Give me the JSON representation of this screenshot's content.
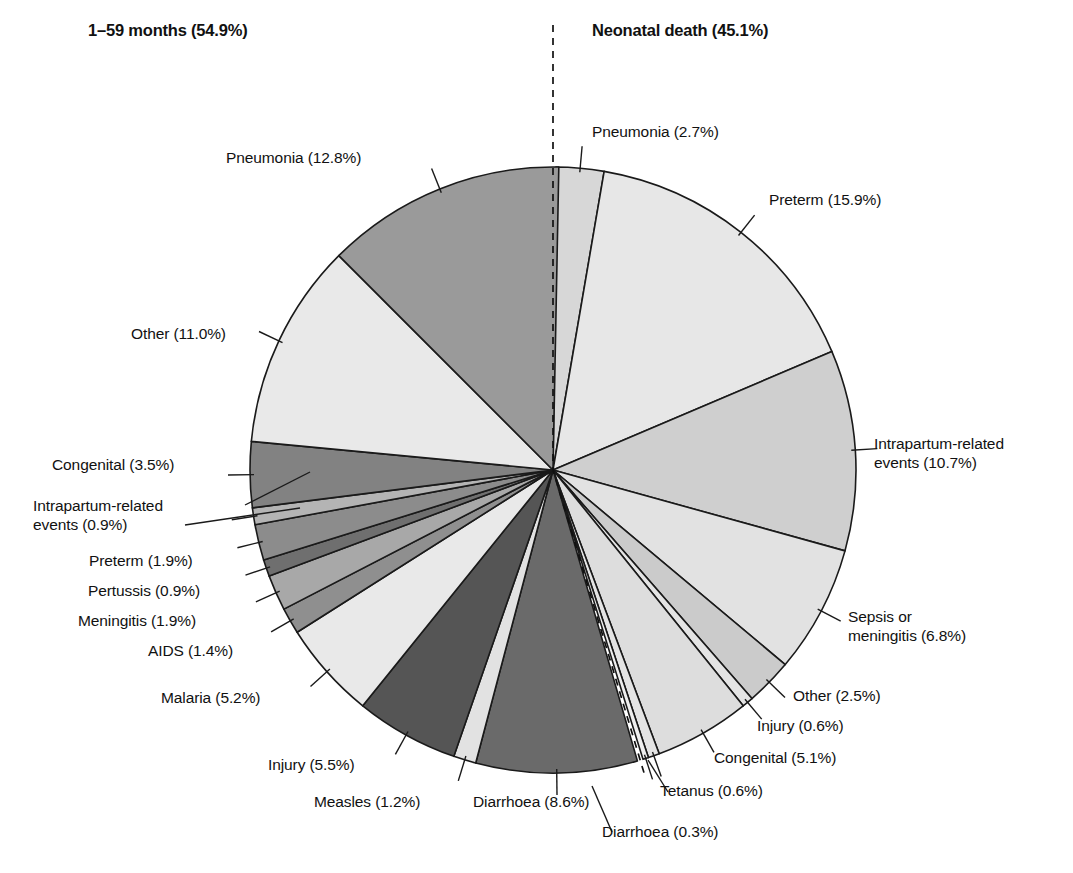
{
  "headers": {
    "left": "1–59 months (54.9%)",
    "right": "Neonatal death (45.1%)"
  },
  "labels": {
    "left": [
      {
        "name": "pneumonia",
        "text": "Pneumonia (12.8%)"
      },
      {
        "name": "other",
        "text": "Other (11.0%)"
      },
      {
        "name": "congenital",
        "text": "Congenital (3.5%)"
      },
      {
        "name": "intrapartum-line1",
        "text": "Intrapartum-related"
      },
      {
        "name": "intrapartum-line2",
        "text": "events (0.9%)"
      },
      {
        "name": "preterm",
        "text": "Preterm (1.9%)"
      },
      {
        "name": "pertussis",
        "text": "Pertussis (0.9%)"
      },
      {
        "name": "meningitis",
        "text": "Meningitis (1.9%)"
      },
      {
        "name": "aids",
        "text": "AIDS (1.4%)"
      },
      {
        "name": "malaria",
        "text": "Malaria (5.2%)"
      },
      {
        "name": "injury",
        "text": "Injury (5.5%)"
      },
      {
        "name": "measles",
        "text": "Measles (1.2%)"
      },
      {
        "name": "diarrhoea",
        "text": "Diarrhoea (8.6%)"
      }
    ],
    "right": [
      {
        "name": "pneumonia",
        "text": "Pneumonia (2.7%)"
      },
      {
        "name": "preterm",
        "text": "Preterm (15.9%)"
      },
      {
        "name": "intrapartum-line1",
        "text": "Intrapartum-related"
      },
      {
        "name": "intrapartum-line2",
        "text": "events (10.7%)"
      },
      {
        "name": "sepsis-line1",
        "text": "Sepsis or"
      },
      {
        "name": "sepsis-line2",
        "text": "meningitis (6.8%)"
      },
      {
        "name": "other",
        "text": "Other (2.5%)"
      },
      {
        "name": "injury",
        "text": "Injury (0.6%)"
      },
      {
        "name": "congenital",
        "text": "Congenital (5.1%)"
      },
      {
        "name": "tetanus",
        "text": "Tetanus (0.6%)"
      },
      {
        "name": "diarrhoea",
        "text": "Diarrhoea (0.3%)"
      }
    ]
  },
  "chart_data": {
    "type": "pie",
    "groups": [
      {
        "name": "1–59 months",
        "total_pct": 54.9,
        "side": "left",
        "slices": [
          {
            "label": "Pneumonia",
            "value": 12.8,
            "color": "#9a9a9a"
          },
          {
            "label": "Other",
            "value": 11.0,
            "color": "#e9e9e9"
          },
          {
            "label": "Congenital",
            "value": 3.5,
            "color": "#828282"
          },
          {
            "label": "Intrapartum-related events",
            "value": 0.9,
            "color": "#b4b4b4"
          },
          {
            "label": "Preterm",
            "value": 1.9,
            "color": "#8c8c8c"
          },
          {
            "label": "Pertussis",
            "value": 0.9,
            "color": "#6f6f6f"
          },
          {
            "label": "Meningitis",
            "value": 1.9,
            "color": "#a8a8a8"
          },
          {
            "label": "AIDS",
            "value": 1.4,
            "color": "#8f8f8f"
          },
          {
            "label": "Malaria",
            "value": 5.2,
            "color": "#e9e9e9"
          },
          {
            "label": "Injury",
            "value": 5.5,
            "color": "#555555"
          },
          {
            "label": "Measles",
            "value": 1.2,
            "color": "#e2e2e2"
          },
          {
            "label": "Diarrhoea",
            "value": 8.6,
            "color": "#6a6a6a"
          }
        ]
      },
      {
        "name": "Neonatal death",
        "total_pct": 45.1,
        "side": "right",
        "slices": [
          {
            "label": "Pneumonia",
            "value": 2.7,
            "color": "#d7d7d7"
          },
          {
            "label": "Preterm",
            "value": 15.9,
            "color": "#e7e7e7"
          },
          {
            "label": "Intrapartum-related events",
            "value": 10.7,
            "color": "#cfcfcf"
          },
          {
            "label": "Sepsis or meningitis",
            "value": 6.8,
            "color": "#e2e2e2"
          },
          {
            "label": "Other",
            "value": 2.5,
            "color": "#cbcbcb"
          },
          {
            "label": "Injury",
            "value": 0.6,
            "color": "#e4e4e4"
          },
          {
            "label": "Congenital",
            "value": 5.1,
            "color": "#dddddd"
          },
          {
            "label": "Tetanus",
            "value": 0.6,
            "color": "#e4e4e4"
          },
          {
            "label": "Diarrhoea",
            "value": 0.3,
            "color": "#efefef"
          }
        ]
      }
    ],
    "geometry": {
      "cx": 553,
      "cy": 470,
      "r": 303,
      "gap_deg": 1.1
    },
    "legend": "none",
    "grid": false
  }
}
